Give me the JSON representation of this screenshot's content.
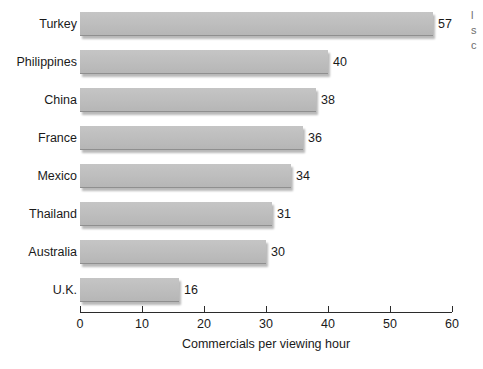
{
  "chart_data": {
    "type": "bar",
    "orientation": "horizontal",
    "title": "",
    "subtitle": "",
    "xlabel": "Commercials per viewing hour",
    "ylabel": "",
    "categories": [
      "Turkey",
      "Philippines",
      "China",
      "France",
      "Mexico",
      "Thailand",
      "Australia",
      "U.K."
    ],
    "values": [
      57,
      40,
      38,
      36,
      34,
      31,
      30,
      16
    ],
    "value_labels": [
      "57",
      "40",
      "38",
      "36",
      "34",
      "31",
      "30",
      "16"
    ],
    "xlim": [
      0,
      60
    ],
    "xticks": [
      0,
      10,
      20,
      30,
      40,
      50,
      60
    ],
    "xtick_labels": [
      "0",
      "10",
      "20",
      "30",
      "40",
      "50",
      "60"
    ],
    "grid": false,
    "legend": null,
    "bar_color": "#bdbdbd",
    "axis_color": "#2b2b2b",
    "background": "#ffffff"
  },
  "edge": {
    "fragment_lines": [
      "l",
      "s",
      "c"
    ]
  }
}
